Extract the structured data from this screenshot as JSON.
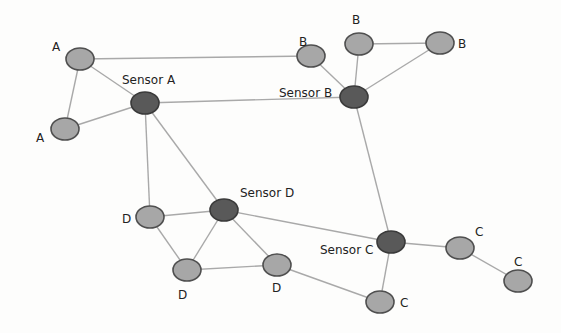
{
  "diagram": {
    "type": "sensor-network",
    "colors": {
      "edge": "#a9a9a9",
      "regular_node_fill": "#a7a7a7",
      "sensor_node_fill": "#595959",
      "node_stroke": "#4f4f4f",
      "label": "#222222"
    },
    "nodes": [
      {
        "id": "a1",
        "label": "A",
        "kind": "regular",
        "x": 80,
        "y": 59,
        "label_x": 52,
        "label_y": 51
      },
      {
        "id": "a2",
        "label": "A",
        "kind": "regular",
        "x": 65,
        "y": 129,
        "label_x": 36,
        "label_y": 142
      },
      {
        "id": "sa",
        "label": "Sensor A",
        "kind": "sensor",
        "x": 145,
        "y": 103,
        "label_x": 122,
        "label_y": 84
      },
      {
        "id": "b1",
        "label": "B",
        "kind": "regular",
        "x": 311,
        "y": 56,
        "label_x": 299,
        "label_y": 46
      },
      {
        "id": "b2",
        "label": "B",
        "kind": "regular",
        "x": 359,
        "y": 44,
        "label_x": 352,
        "label_y": 24
      },
      {
        "id": "b3",
        "label": "B",
        "kind": "regular",
        "x": 440,
        "y": 43,
        "label_x": 458,
        "label_y": 48
      },
      {
        "id": "sb",
        "label": "Sensor B",
        "kind": "sensor",
        "x": 354,
        "y": 97,
        "label_x": 279,
        "label_y": 97
      },
      {
        "id": "sd",
        "label": "Sensor D",
        "kind": "sensor",
        "x": 224,
        "y": 210,
        "label_x": 240,
        "label_y": 197
      },
      {
        "id": "d1",
        "label": "D",
        "kind": "regular",
        "x": 150,
        "y": 217,
        "label_x": 122,
        "label_y": 223
      },
      {
        "id": "d2",
        "label": "D",
        "kind": "regular",
        "x": 187,
        "y": 270,
        "label_x": 178,
        "label_y": 299
      },
      {
        "id": "d3",
        "label": "D",
        "kind": "regular",
        "x": 277,
        "y": 265,
        "label_x": 272,
        "label_y": 292
      },
      {
        "id": "sc",
        "label": "Sensor C",
        "kind": "sensor",
        "x": 391,
        "y": 242,
        "label_x": 320,
        "label_y": 254
      },
      {
        "id": "c1",
        "label": "C",
        "kind": "regular",
        "x": 460,
        "y": 248,
        "label_x": 475,
        "label_y": 236
      },
      {
        "id": "c2",
        "label": "C",
        "kind": "regular",
        "x": 518,
        "y": 281,
        "label_x": 514,
        "label_y": 266
      },
      {
        "id": "c3",
        "label": "C",
        "kind": "regular",
        "x": 380,
        "y": 302,
        "label_x": 400,
        "label_y": 307
      }
    ],
    "edges": [
      [
        "a1",
        "a2"
      ],
      [
        "a1",
        "sa"
      ],
      [
        "a1",
        "b1"
      ],
      [
        "a2",
        "sa"
      ],
      [
        "sa",
        "sb"
      ],
      [
        "sa",
        "d1"
      ],
      [
        "sa",
        "sd"
      ],
      [
        "b1",
        "sb"
      ],
      [
        "b2",
        "sb"
      ],
      [
        "b3",
        "sb"
      ],
      [
        "b2",
        "b3"
      ],
      [
        "sb",
        "sc"
      ],
      [
        "d1",
        "sd"
      ],
      [
        "d1",
        "d2"
      ],
      [
        "sd",
        "d2"
      ],
      [
        "sd",
        "d3"
      ],
      [
        "sd",
        "sc"
      ],
      [
        "d2",
        "d3"
      ],
      [
        "d3",
        "c3"
      ],
      [
        "sc",
        "c3"
      ],
      [
        "sc",
        "c1"
      ],
      [
        "c1",
        "c2"
      ]
    ]
  }
}
